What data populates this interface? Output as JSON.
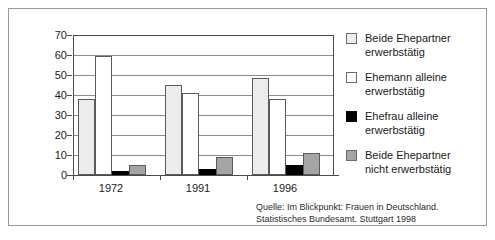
{
  "chart_data": {
    "type": "bar",
    "title": "",
    "subtitle": "",
    "xlabel": "",
    "ylabel": "",
    "categories": [
      "1972",
      "1991",
      "1996"
    ],
    "ylim": [
      0,
      70
    ],
    "yticks": [
      0,
      10,
      20,
      30,
      40,
      50,
      60,
      70
    ],
    "ytick_labels": [
      "0",
      "10",
      "20",
      "30",
      "40",
      "50",
      "60",
      "70"
    ],
    "grid": true,
    "legend_position": "right",
    "series": [
      {
        "name": "Beide Ehepartner erwerbstätig",
        "label_line1": "Beide Ehepartner",
        "label_line2": "erwerbstätig",
        "color": "#ececed",
        "values": [
          38,
          45,
          48.5
        ]
      },
      {
        "name": "Ehemann alleine erwerbstätig",
        "label_line1": "Ehemann alleine",
        "label_line2": "erwerbstätig",
        "color": "#ffffff",
        "values": [
          59.5,
          41,
          38
        ]
      },
      {
        "name": "Ehefrau alleine erwerbstätig",
        "label_line1": "Ehefrau alleine",
        "label_line2": "erwerbstätig",
        "color": "#000000",
        "values": [
          2,
          3,
          5
        ]
      },
      {
        "name": "Beide Ehepartner nicht erwerbstätig",
        "label_line1": "Beide Ehepartner",
        "label_line2": "nicht erwerbstätig",
        "color": "#a5a5a5",
        "values": [
          5,
          9,
          11
        ]
      }
    ]
  },
  "source": {
    "line1": "Quelle: Im Blickpunkt: Frauen in Deutschland.",
    "line2": "Statistisches Bundesamt. Stuttgart 1998"
  }
}
